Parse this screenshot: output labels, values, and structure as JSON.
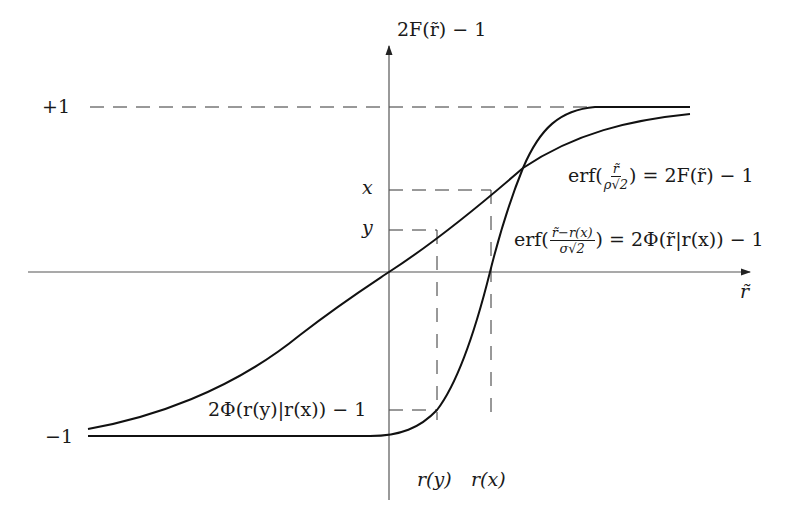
{
  "diagram": {
    "type": "function-plot",
    "y_axis_label": "2F(r̃) − 1",
    "x_axis_label": "r̃",
    "y_ticks": {
      "plus_one": "+1",
      "minus_one": "−1",
      "x_level": "x",
      "y_level": "y"
    },
    "x_ticks": {
      "r_y": "r(y)",
      "r_x": "r(x)"
    },
    "curves": {
      "wide": {
        "label_prefix": "erf(",
        "frac_num": "r̃",
        "frac_den": "ρ√2",
        "label_suffix": ") = 2F(r̃) − 1"
      },
      "steep": {
        "label_prefix": "erf(",
        "frac_num": "r̃−r(x)",
        "frac_den": "σ√2",
        "label_suffix": ") = 2Φ(r̃|r(x)) − 1"
      }
    },
    "annotation": "2Φ(r(y)|r(x)) − 1",
    "colors": {
      "curve": "#111111",
      "axis": "#555555",
      "dash": "#333333",
      "text": "#1a1a1a"
    }
  }
}
